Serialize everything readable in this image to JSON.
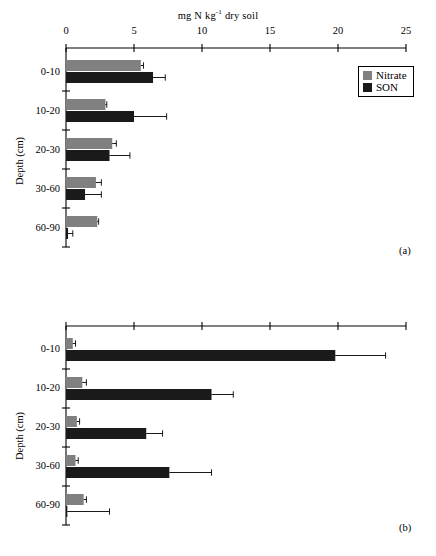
{
  "figure": {
    "axis_title_parts": {
      "pre": "mg N kg",
      "sup": "-1",
      "post": " dry soil"
    },
    "axis_title_full": "mg N kg-1 dry soil",
    "y_axis_title": "Depth (cm)",
    "panel_a_tag": "(a)",
    "panel_b_tag": "(b)",
    "colors": {
      "nitrate": "#808080",
      "son": "#1a1a1a",
      "axis": "#000000"
    }
  },
  "legend": {
    "position": "top-right of panel (a)",
    "items": [
      {
        "label": "Nitrate",
        "color": "#808080"
      },
      {
        "label": "SON",
        "color": "#1a1a1a"
      }
    ]
  },
  "chart_data": [
    {
      "type": "bar",
      "orientation": "horizontal",
      "panel": "(a)",
      "title": "mg N kg-1 dry soil",
      "xlabel": "mg N kg-1 dry soil",
      "ylabel": "Depth (cm)",
      "xlim": [
        0,
        25
      ],
      "xticks": [
        0,
        5,
        10,
        15,
        20,
        25
      ],
      "xtick_labels": [
        "0",
        "5",
        "10",
        "15",
        "20",
        "25"
      ],
      "grid": false,
      "legend": [
        "Nitrate",
        "SON"
      ],
      "categories": [
        "0-10",
        "10-20",
        "20-30",
        "30-60",
        "60-90"
      ],
      "series": [
        {
          "name": "Nitrate",
          "color": "#808080",
          "values": [
            5.5,
            2.9,
            3.4,
            2.2,
            2.3
          ],
          "errors": [
            0.2,
            0.1,
            0.3,
            0.4,
            0.1
          ]
        },
        {
          "name": "SON",
          "color": "#1a1a1a",
          "values": [
            6.4,
            5.0,
            3.2,
            1.4,
            0.15
          ],
          "errors": [
            0.9,
            2.4,
            1.5,
            1.2,
            0.35
          ]
        }
      ]
    },
    {
      "type": "bar",
      "orientation": "horizontal",
      "panel": "(b)",
      "title": "",
      "xlabel": "mg N kg-1 dry soil",
      "ylabel": "Depth (cm)",
      "xlim": [
        0,
        25
      ],
      "xticks": [
        0,
        5,
        10,
        15,
        20,
        25
      ],
      "xtick_labels": [
        "",
        "",
        "",
        "",
        "",
        ""
      ],
      "grid": false,
      "legend": [
        "Nitrate",
        "SON"
      ],
      "categories": [
        "0-10",
        "10-20",
        "20-30",
        "30-60",
        "60-90"
      ],
      "series": [
        {
          "name": "Nitrate",
          "color": "#808080",
          "values": [
            0.5,
            1.2,
            0.8,
            0.7,
            1.3
          ],
          "errors": [
            0.2,
            0.3,
            0.2,
            0.2,
            0.2
          ]
        },
        {
          "name": "SON",
          "color": "#1a1a1a",
          "values": [
            19.8,
            10.7,
            5.9,
            7.6,
            0.1
          ],
          "errors": [
            3.7,
            1.6,
            1.2,
            3.1,
            3.1
          ]
        }
      ]
    }
  ]
}
